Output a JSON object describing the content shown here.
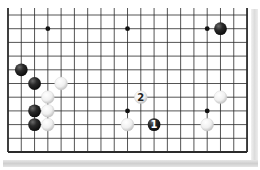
{
  "board": {
    "columns": 19,
    "rows": 11,
    "origin_x": 8,
    "origin_y": 15,
    "spacing_x": 13.28,
    "spacing_y": 13.7,
    "edges": {
      "top": false,
      "bottom": true,
      "left": true,
      "right": true
    },
    "line_color": "#2a2a2a",
    "background": "#ffffff"
  },
  "star_points": [
    {
      "col": 3,
      "row": 1
    },
    {
      "col": 9,
      "row": 1
    },
    {
      "col": 15,
      "row": 1
    },
    {
      "col": 9,
      "row": 7
    },
    {
      "col": 15,
      "row": 7
    }
  ],
  "stones": [
    {
      "color": "black",
      "col": 16,
      "row": 1,
      "label": ""
    },
    {
      "color": "black",
      "col": 1,
      "row": 4,
      "label": ""
    },
    {
      "color": "black",
      "col": 2,
      "row": 5,
      "label": ""
    },
    {
      "color": "white",
      "col": 4,
      "row": 5,
      "label": ""
    },
    {
      "color": "white",
      "col": 3,
      "row": 6,
      "label": ""
    },
    {
      "color": "black",
      "col": 2,
      "row": 7,
      "label": ""
    },
    {
      "color": "white",
      "col": 3,
      "row": 7,
      "label": ""
    },
    {
      "color": "black",
      "col": 2,
      "row": 8,
      "label": ""
    },
    {
      "color": "white",
      "col": 3,
      "row": 8,
      "label": ""
    },
    {
      "color": "white",
      "col": 10,
      "row": 6,
      "label": "2"
    },
    {
      "color": "white",
      "col": 9,
      "row": 8,
      "label": ""
    },
    {
      "color": "black",
      "col": 11,
      "row": 8,
      "label": "1"
    },
    {
      "color": "white",
      "col": 16,
      "row": 6,
      "label": ""
    },
    {
      "color": "white",
      "col": 15,
      "row": 8,
      "label": ""
    }
  ],
  "colors": {
    "black_stone": "#1e1e1e",
    "black_highlight": "#6a6a6a",
    "white_stone": "#f4f4f4",
    "white_shade": "#c8c8c8",
    "label_on_black": "#ffffff",
    "label_on_white": "#222222"
  }
}
